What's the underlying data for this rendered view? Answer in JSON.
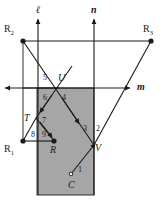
{
  "figure": {
    "width": 164,
    "height": 206,
    "background": "#ffffff",
    "stroke_color": "#1a1a1a",
    "shaded_fill": "#a6a6a6"
  },
  "shaded_region": {
    "name": "gray-rectangle",
    "x": 37,
    "y": 88,
    "width": 57,
    "height": 107,
    "fill": "#a6a6a6"
  },
  "lines": [
    {
      "id": "l",
      "label": "ℓ",
      "orientation": "vertical",
      "label_x": 36,
      "label_y": 5
    },
    {
      "id": "n",
      "label": "n",
      "orientation": "vertical",
      "label_x": 91,
      "label_y": 5
    },
    {
      "id": "m",
      "label": "m",
      "orientation": "horizontal",
      "label_x": 137,
      "label_y": 82
    }
  ],
  "points": [
    {
      "id": "R2",
      "label": "R",
      "sub": "2",
      "x": 23,
      "y": 41,
      "label_x": 4,
      "label_y": 24,
      "dot": true
    },
    {
      "id": "R3",
      "label": "R",
      "sub": "3",
      "x": 151,
      "y": 41,
      "label_x": 143,
      "label_y": 24,
      "dot": true
    },
    {
      "id": "R1",
      "label": "R",
      "sub": "1",
      "x": 23,
      "y": 141,
      "label_x": 4,
      "label_y": 144,
      "dot": true
    },
    {
      "id": "R",
      "label": "R",
      "sub": "",
      "x": 54,
      "y": 141,
      "label_x": 50,
      "label_y": 145,
      "dot": true
    },
    {
      "id": "U",
      "label": "U",
      "sub": "",
      "x": 57,
      "y": 88,
      "label_x": 58,
      "label_y": 73,
      "dot": false
    },
    {
      "id": "T",
      "label": "T",
      "sub": "",
      "x": 36,
      "y": 118,
      "label_x": 24,
      "label_y": 113,
      "dot": false
    },
    {
      "id": "V",
      "label": "V",
      "sub": "",
      "x": 94,
      "y": 145,
      "label_x": 95,
      "label_y": 143,
      "dot": false
    },
    {
      "id": "C",
      "label": "C",
      "sub": "",
      "x": 71,
      "y": 176,
      "label_x": 68,
      "label_y": 180,
      "dot": false
    }
  ],
  "segment_numbers": [
    {
      "id": "1",
      "label": "1",
      "x": 78,
      "y": 166
    },
    {
      "id": "2",
      "label": "2",
      "x": 96,
      "y": 125
    },
    {
      "id": "3",
      "label": "3",
      "x": 83,
      "y": 125
    },
    {
      "id": "4",
      "label": "4",
      "x": 62,
      "y": 94
    },
    {
      "id": "5",
      "label": "5",
      "x": 43,
      "y": 74
    },
    {
      "id": "6",
      "label": "6",
      "x": 43,
      "y": 94
    },
    {
      "id": "7",
      "label": "7",
      "x": 42,
      "y": 117
    },
    {
      "id": "8",
      "label": "8",
      "x": 31,
      "y": 131
    },
    {
      "id": "9",
      "label": "9",
      "x": 42,
      "y": 131
    }
  ],
  "paths": {
    "ray_C_to_V": "1",
    "ray_V_to_R3": "2",
    "ray_U_to_V": "3",
    "segment_U_down": "4",
    "segment_R2_to_U": "5",
    "segment_U_to_T": "6",
    "segment_T_to_R": "7",
    "segment_R1_to_T": "8",
    "segment_T_to_R_inner": "9"
  }
}
